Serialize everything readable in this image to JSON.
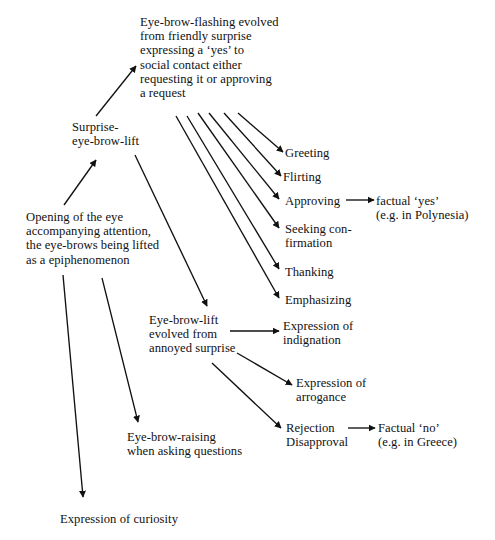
{
  "diagram": {
    "background_color": "#ffffff",
    "ink_color": "#111111",
    "nodes": [
      {
        "id": "eyebrow-flashing",
        "name": "node-eyebrow-flashing",
        "text": "Eye-brow-flashing evolved\nfrom friendly surprise\nexpressing a ‘yes’ to\nsocial contact either\nrequesting it or approving\na request",
        "x": 140,
        "y": 15
      },
      {
        "id": "surprise-eye-brow-lift",
        "name": "node-surprise-eye-brow-lift",
        "text": "Surprise-\neye-brow-lift",
        "x": 72,
        "y": 120
      },
      {
        "id": "opening-of-the-eye",
        "name": "node-opening-of-the-eye",
        "text": "Opening of the eye\naccompanying attention,\nthe eye-brows being lifted\nas a epiphenomenon",
        "x": 26,
        "y": 210
      },
      {
        "id": "greeting",
        "name": "node-greeting",
        "text": "Greeting",
        "x": 285,
        "y": 146
      },
      {
        "id": "flirting",
        "name": "node-flirting",
        "text": "Flirting",
        "x": 283,
        "y": 170
      },
      {
        "id": "approving",
        "name": "node-approving",
        "text": "Approving",
        "x": 285,
        "y": 194
      },
      {
        "id": "factual-yes",
        "name": "node-factual-yes",
        "text": "factual ‘yes’\n(e.g. in Polynesia)",
        "x": 376,
        "y": 194
      },
      {
        "id": "seeking-confirmation",
        "name": "node-seeking-confirmation",
        "text": "Seeking con-\nfirmation",
        "x": 285,
        "y": 222
      },
      {
        "id": "thanking",
        "name": "node-thanking",
        "text": "Thanking",
        "x": 285,
        "y": 265
      },
      {
        "id": "emphasizing",
        "name": "node-emphasizing",
        "text": "Emphasizing",
        "x": 285,
        "y": 293
      },
      {
        "id": "eyebrow-lift-annoyed",
        "name": "node-eyebrow-lift-annoyed-surprise",
        "text": "Eye-brow-lift\nevolved from\nannoyed surprise",
        "x": 149,
        "y": 313
      },
      {
        "id": "expression-of-indignation",
        "name": "node-expression-of-indignation",
        "text": "Expression of\nindignation",
        "x": 283,
        "y": 319
      },
      {
        "id": "expression-of-arrogance",
        "name": "node-expression-of-arrogance",
        "text": "Expression of\narrogance",
        "x": 296,
        "y": 376
      },
      {
        "id": "rejection-disapproval",
        "name": "node-rejection-disapproval",
        "text": "Rejection\nDisapproval",
        "x": 286,
        "y": 421
      },
      {
        "id": "factual-no",
        "name": "node-factual-no",
        "text": "Factual ‘no’\n(e.g. in Greece)",
        "x": 378,
        "y": 421
      },
      {
        "id": "eyebrow-raising-questions",
        "name": "node-eyebrow-raising-when-asking-questions",
        "text": "Eye-brow-raising\nwhen asking questions",
        "x": 127,
        "y": 430
      },
      {
        "id": "expression-of-curiosity",
        "name": "node-expression-of-curiosity",
        "text": "Expression of curiosity",
        "x": 60,
        "y": 512
      }
    ],
    "arrows": [
      {
        "id": "a1",
        "name": "arrow-opening-to-surprise",
        "from": "opening-of-the-eye",
        "to": "surprise-eye-brow-lift",
        "x1": 64,
        "y1": 205,
        "x2": 96,
        "y2": 160
      },
      {
        "id": "a2",
        "name": "arrow-surprise-to-eyebrow-flashing",
        "from": "surprise-eye-brow-lift",
        "to": "eyebrow-flashing",
        "x1": 96,
        "y1": 116,
        "x2": 136,
        "y2": 66
      },
      {
        "id": "a3",
        "name": "arrow-flashing-to-greeting",
        "from": "eyebrow-flashing",
        "to": "greeting",
        "x1": 238,
        "y1": 113,
        "x2": 283,
        "y2": 152
      },
      {
        "id": "a4",
        "name": "arrow-flashing-to-flirting",
        "from": "eyebrow-flashing",
        "to": "flirting",
        "x1": 224,
        "y1": 113,
        "x2": 281,
        "y2": 176
      },
      {
        "id": "a5",
        "name": "arrow-flashing-to-approving",
        "from": "eyebrow-flashing",
        "to": "approving",
        "x1": 209,
        "y1": 113,
        "x2": 279,
        "y2": 199
      },
      {
        "id": "a6",
        "name": "arrow-flashing-to-seeking-confirmation",
        "from": "eyebrow-flashing",
        "to": "seeking-confirmation",
        "x1": 198,
        "y1": 113,
        "x2": 279,
        "y2": 228
      },
      {
        "id": "a7",
        "name": "arrow-flashing-to-thanking",
        "from": "eyebrow-flashing",
        "to": "thanking",
        "x1": 187,
        "y1": 116,
        "x2": 279,
        "y2": 269
      },
      {
        "id": "a8",
        "name": "arrow-flashing-to-emphasizing",
        "from": "eyebrow-flashing",
        "to": "emphasizing",
        "x1": 176,
        "y1": 116,
        "x2": 279,
        "y2": 298
      },
      {
        "id": "a9",
        "name": "arrow-approving-to-factual-yes",
        "from": "approving",
        "to": "factual-yes",
        "x1": 346,
        "y1": 200,
        "x2": 374,
        "y2": 200
      },
      {
        "id": "a10",
        "name": "arrow-surprise-to-eyebrow-lift",
        "from": "surprise-eye-brow-lift",
        "to": "eyebrow-lift-annoyed",
        "x1": 135,
        "y1": 155,
        "x2": 207,
        "y2": 306
      },
      {
        "id": "a11",
        "name": "arrow-eyebrow-lift-to-indignation",
        "from": "eyebrow-lift-annoyed",
        "to": "expression-of-indignation",
        "x1": 230,
        "y1": 331,
        "x2": 279,
        "y2": 331
      },
      {
        "id": "a12",
        "name": "arrow-eyebrow-lift-to-arrogance",
        "from": "eyebrow-lift-annoyed",
        "to": "expression-of-arrogance",
        "x1": 237,
        "y1": 353,
        "x2": 292,
        "y2": 385
      },
      {
        "id": "a13",
        "name": "arrow-eyebrow-lift-to-rejection",
        "from": "eyebrow-lift-annoyed",
        "to": "rejection-disapproval",
        "x1": 212,
        "y1": 363,
        "x2": 281,
        "y2": 428
      },
      {
        "id": "a14",
        "name": "arrow-rejection-to-factual-no",
        "from": "rejection-disapproval",
        "to": "factual-no",
        "x1": 348,
        "y1": 428,
        "x2": 375,
        "y2": 428
      },
      {
        "id": "a15",
        "name": "arrow-opening-to-eyebrow-raising",
        "from": "opening-of-the-eye",
        "to": "eyebrow-raising-questions",
        "x1": 102,
        "y1": 278,
        "x2": 138,
        "y2": 422
      },
      {
        "id": "a16",
        "name": "arrow-opening-to-curiosity",
        "from": "opening-of-the-eye",
        "to": "expression-of-curiosity",
        "x1": 63,
        "y1": 275,
        "x2": 83,
        "y2": 497
      }
    ]
  }
}
